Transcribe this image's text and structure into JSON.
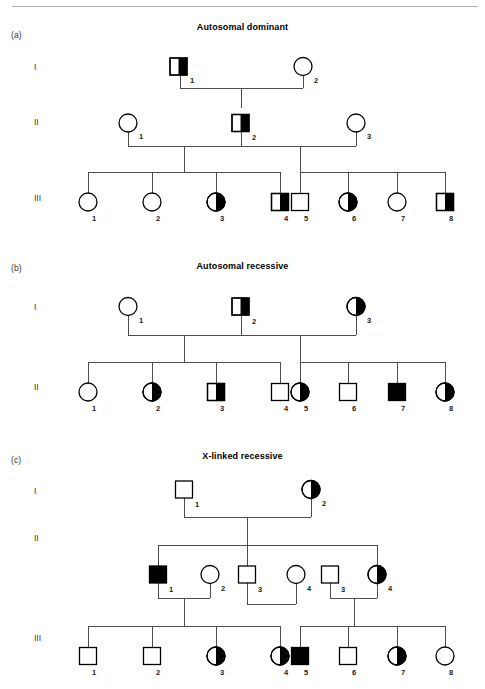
{
  "figure": {
    "top_rule": true,
    "background": "#ffffff",
    "line_color": "#4d4d4d",
    "symbol_stroke": "#000000",
    "fill_color": "#000000",
    "empty_color": "#ffffff"
  },
  "panels": [
    {
      "letter": "(a)",
      "title": "Autosomal dominant",
      "generations": [
        {
          "label": "I",
          "individuals": [
            {
              "id": "1",
              "sex": "male",
              "status": "half-filled"
            },
            {
              "id": "2",
              "sex": "female",
              "status": "empty"
            }
          ]
        },
        {
          "label": "II",
          "individuals": [
            {
              "id": "1",
              "sex": "female",
              "status": "empty"
            },
            {
              "id": "2",
              "sex": "male",
              "status": "half-filled"
            },
            {
              "id": "3",
              "sex": "female",
              "status": "empty"
            }
          ]
        },
        {
          "label": "III",
          "individuals": [
            {
              "id": "1",
              "sex": "female",
              "status": "empty"
            },
            {
              "id": "2",
              "sex": "female",
              "status": "empty"
            },
            {
              "id": "3",
              "sex": "female",
              "status": "half-filled"
            },
            {
              "id": "4",
              "sex": "male",
              "status": "half-filled"
            },
            {
              "id": "5",
              "sex": "male",
              "status": "empty"
            },
            {
              "id": "6",
              "sex": "female",
              "status": "half-filled"
            },
            {
              "id": "7",
              "sex": "female",
              "status": "empty"
            },
            {
              "id": "8",
              "sex": "male",
              "status": "half-filled"
            }
          ]
        }
      ]
    },
    {
      "letter": "(b)",
      "title": "Autosomal recessive",
      "generations": [
        {
          "label": "I",
          "individuals": [
            {
              "id": "1",
              "sex": "female",
              "status": "empty"
            },
            {
              "id": "2",
              "sex": "male",
              "status": "half-filled"
            },
            {
              "id": "3",
              "sex": "female",
              "status": "half-filled"
            }
          ]
        },
        {
          "label": "II",
          "individuals": [
            {
              "id": "1",
              "sex": "female",
              "status": "empty"
            },
            {
              "id": "2",
              "sex": "female",
              "status": "half-filled"
            },
            {
              "id": "3",
              "sex": "male",
              "status": "half-filled"
            },
            {
              "id": "4",
              "sex": "male",
              "status": "empty"
            },
            {
              "id": "5",
              "sex": "female",
              "status": "half-filled"
            },
            {
              "id": "6",
              "sex": "male",
              "status": "empty"
            },
            {
              "id": "7",
              "sex": "male",
              "status": "filled"
            },
            {
              "id": "8",
              "sex": "female",
              "status": "half-filled"
            }
          ]
        }
      ]
    },
    {
      "letter": "(c)",
      "title": "X-linked recessive",
      "generations": [
        {
          "label": "I",
          "individuals": [
            {
              "id": "1",
              "sex": "male",
              "status": "empty"
            },
            {
              "id": "2",
              "sex": "female",
              "status": "half-filled"
            }
          ]
        },
        {
          "label": "II",
          "individuals": [
            {
              "id": "1",
              "sex": "male",
              "status": "filled"
            },
            {
              "id": "2",
              "sex": "female",
              "status": "empty"
            },
            {
              "id": "3",
              "sex": "male",
              "status": "empty"
            },
            {
              "id": "4",
              "sex": "female",
              "status": "empty"
            },
            {
              "id": "3",
              "sex": "male",
              "status": "empty"
            },
            {
              "id": "4",
              "sex": "female",
              "status": "half-filled"
            }
          ]
        },
        {
          "label": "III",
          "individuals": [
            {
              "id": "1",
              "sex": "male",
              "status": "empty"
            },
            {
              "id": "2",
              "sex": "male",
              "status": "empty"
            },
            {
              "id": "3",
              "sex": "female",
              "status": "half-filled"
            },
            {
              "id": "4",
              "sex": "female",
              "status": "half-filled"
            },
            {
              "id": "5",
              "sex": "male",
              "status": "filled"
            },
            {
              "id": "6",
              "sex": "male",
              "status": "empty"
            },
            {
              "id": "7",
              "sex": "female",
              "status": "half-filled"
            },
            {
              "id": "8",
              "sex": "female",
              "status": "empty"
            }
          ]
        }
      ]
    }
  ]
}
